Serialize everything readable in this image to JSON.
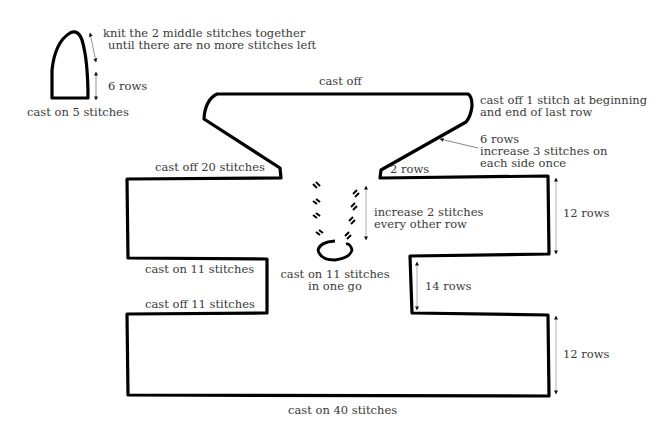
{
  "small_piece": {
    "top_instruction_line1": "knit the 2 middle stitches together",
    "top_instruction_line2": "until there are no more stitches left",
    "rows_label": "6 rows",
    "cast_on_label": "cast on 5 stitches"
  },
  "main_piece": {
    "top_label": "cast off",
    "top_right_line1": "cast off 1 stitch at beginning",
    "top_right_line2": "and end of last row",
    "slope_line1": "6 rows",
    "slope_line2": "increase 3 stitches on",
    "slope_line3": "each side once",
    "shoulder_left_label": "cast off 20 stitches",
    "shoulder_right_label": "2 rows",
    "upper_right_rows": "12 rows",
    "center_increase_line1": "increase 2 stitches",
    "center_increase_line2": "every other row",
    "center_cast_on_line1": "cast on 11 stitches",
    "center_cast_on_line2": "in one go",
    "left_cast_on_label": "cast on 11 stitches",
    "left_cast_off_label": "cast off 11 stitches",
    "middle_right_rows": "14 rows",
    "lower_right_rows": "12 rows",
    "bottom_label": "cast on 40 stitches"
  },
  "colors": {
    "outline": "#000000",
    "text": "#3a3a3a",
    "arrow": "#555555",
    "background": "#ffffff"
  }
}
